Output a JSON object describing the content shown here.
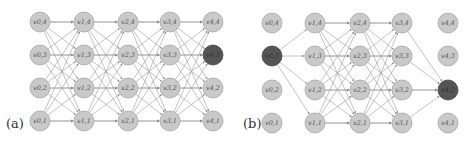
{
  "panels": [
    {
      "id": "a",
      "label": "(a)",
      "label_pos": [
        6,
        118
      ],
      "columns_x": [
        40,
        84,
        128,
        170,
        213
      ],
      "rows_y": [
        22,
        55,
        88,
        121
      ],
      "row_index": [
        4,
        3,
        2,
        1
      ],
      "radius": 10,
      "highlighted": [
        [
          4,
          3
        ]
      ],
      "edges": "full_between_consecutive_columns"
    },
    {
      "id": "b",
      "label": "(b)",
      "label_pos": [
        243,
        118
      ],
      "columns_x": [
        272,
        315,
        360,
        402,
        448
      ],
      "rows_y": [
        23,
        56,
        90,
        123
      ],
      "row_index": [
        4,
        3,
        2,
        1
      ],
      "radius": 10,
      "highlighted": [
        [
          0,
          3
        ],
        [
          4,
          2
        ]
      ],
      "edges": "source_v03_to_col1_full_col1_col2_col2_col3_col3_to_v42"
    }
  ],
  "node_label_prefix": "v",
  "colors": {
    "node_fill": "#c9c9c9",
    "node_stroke": "#a5a5a5",
    "highlight_fill": "#555555",
    "edge": "#9a9a9a"
  }
}
